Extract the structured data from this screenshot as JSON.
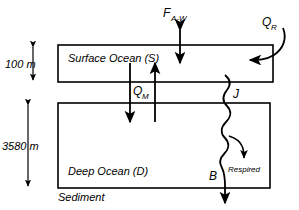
{
  "diagram": {
    "stroke_color": "#000000",
    "background_color": "#ffffff",
    "boxes": [
      {
        "id": "surface",
        "label": "Surface Ocean (S)",
        "depth_label": "100 m"
      },
      {
        "id": "deep",
        "label": "Deep Ocean (D)",
        "depth_label": "3580 m"
      }
    ],
    "sediment_label": "Sediment",
    "fluxes": [
      {
        "id": "air_water",
        "symbol": "F",
        "subscript": "A-W",
        "kind": "double-arrow-vertical"
      },
      {
        "id": "river",
        "symbol": "Q",
        "subscript": "R",
        "kind": "curved-arrow-inbound"
      },
      {
        "id": "mixing",
        "symbol": "Q",
        "subscript": "M",
        "kind": "two-vertical-arrows"
      },
      {
        "id": "export",
        "symbol": "J",
        "subscript": "",
        "kind": "wavy-line"
      },
      {
        "id": "burial",
        "symbol": "B",
        "subscript": "",
        "kind": "wavy-arrow-down"
      }
    ],
    "annotations": [
      {
        "id": "respired",
        "label": "Respired"
      }
    ]
  }
}
